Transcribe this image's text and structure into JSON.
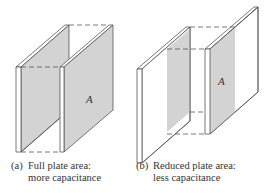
{
  "figure_a": {
    "label": "(a)",
    "caption_line1": "Full plate area:",
    "caption_line2": "more capacitance",
    "area_symbol": "A"
  },
  "figure_b": {
    "label": "(b)",
    "caption_line1": "Reduced plate area:",
    "caption_line2": "less capacitance",
    "area_symbol": "A"
  },
  "colors": {
    "plate_shade": "#d3d3d3",
    "line": "#555555",
    "text": "#333333"
  }
}
